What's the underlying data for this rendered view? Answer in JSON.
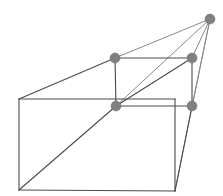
{
  "diagram": {
    "type": "line-diagram",
    "canvas": {
      "width": 223,
      "height": 196,
      "background": "#ffffff"
    },
    "colors": {
      "edge_stroke": "#4a4a4a",
      "ray_stroke": "#8a8a8a",
      "dot_fill": "#808080",
      "dot_stroke": "#6e6e6e",
      "background": "#ffffff"
    },
    "stroke_widths": {
      "edge": 1.1,
      "ray": 1.0
    },
    "points": {
      "vanishing_point": {
        "x": 210,
        "y": 19,
        "label": "vanishing-point"
      },
      "front_top_left": {
        "x": 19,
        "y": 99,
        "label": "front-top-left"
      },
      "front_top_right": {
        "x": 175,
        "y": 99,
        "label": "front-top-right"
      },
      "front_bottom_left": {
        "x": 19,
        "y": 190,
        "label": "front-bottom-left"
      },
      "front_bottom_right": {
        "x": 175,
        "y": 191,
        "label": "front-bottom-right"
      },
      "inner_top_left": {
        "x": 115,
        "y": 58,
        "label": "inner-top-left"
      },
      "inner_top_right": {
        "x": 192,
        "y": 58,
        "label": "inner-top-right"
      },
      "inner_bottom_left": {
        "x": 116,
        "y": 106,
        "label": "inner-bottom-left"
      },
      "inner_bottom_right": {
        "x": 192,
        "y": 106,
        "label": "inner-bottom-right"
      }
    },
    "dot_radius": 5,
    "dots": [
      {
        "name": "vanishing-point-dot",
        "cx": 210,
        "cy": 19,
        "r": 5
      },
      {
        "name": "inner-top-left-dot",
        "cx": 115,
        "cy": 58,
        "r": 5
      },
      {
        "name": "inner-top-right-dot",
        "cx": 192,
        "cy": 58,
        "r": 5
      },
      {
        "name": "inner-bottom-left-dot",
        "cx": 116,
        "cy": 106,
        "r": 5
      },
      {
        "name": "inner-bottom-right-dot",
        "cx": 192,
        "cy": 106,
        "r": 5
      }
    ],
    "edges": [
      {
        "name": "front-face-top-edge",
        "x1": 19,
        "y1": 99,
        "x2": 175,
        "y2": 99
      },
      {
        "name": "front-face-left-edge",
        "x1": 19,
        "y1": 99,
        "x2": 19,
        "y2": 190
      },
      {
        "name": "front-face-bottom-edge",
        "x1": 19,
        "y1": 190,
        "x2": 175,
        "y2": 191
      },
      {
        "name": "front-face-right-edge",
        "x1": 175,
        "y1": 99,
        "x2": 175,
        "y2": 191
      },
      {
        "name": "inner-face-top-edge",
        "x1": 115,
        "y1": 58,
        "x2": 192,
        "y2": 58
      },
      {
        "name": "inner-face-left-edge",
        "x1": 115,
        "y1": 58,
        "x2": 116,
        "y2": 106
      },
      {
        "name": "inner-face-bottom-edge",
        "x1": 116,
        "y1": 106,
        "x2": 192,
        "y2": 106
      },
      {
        "name": "inner-face-right-edge",
        "x1": 192,
        "y1": 58,
        "x2": 192,
        "y2": 106
      },
      {
        "name": "top-receding-edge-left",
        "x1": 19,
        "y1": 99,
        "x2": 115,
        "y2": 58
      },
      {
        "name": "inner-face-diagonal",
        "x1": 116,
        "y1": 106,
        "x2": 192,
        "y2": 58
      },
      {
        "name": "front-face-diagonal",
        "x1": 19,
        "y1": 190,
        "x2": 116,
        "y2": 106
      },
      {
        "name": "lower-right-receding-edge",
        "x1": 175,
        "y1": 191,
        "x2": 192,
        "y2": 106
      }
    ],
    "rays": [
      {
        "name": "ray-to-inner-top-left",
        "x1": 115,
        "y1": 58,
        "x2": 210,
        "y2": 19
      },
      {
        "name": "ray-to-inner-top-right",
        "x1": 192,
        "y1": 58,
        "x2": 210,
        "y2": 19
      },
      {
        "name": "ray-to-inner-bottom-right",
        "x1": 192,
        "y1": 106,
        "x2": 210,
        "y2": 19
      },
      {
        "name": "ray-diagonal-to-vp",
        "x1": 116,
        "y1": 106,
        "x2": 210,
        "y2": 19
      },
      {
        "name": "ray-from-front-bottom-right",
        "x1": 175,
        "y1": 191,
        "x2": 210,
        "y2": 19
      }
    ]
  }
}
